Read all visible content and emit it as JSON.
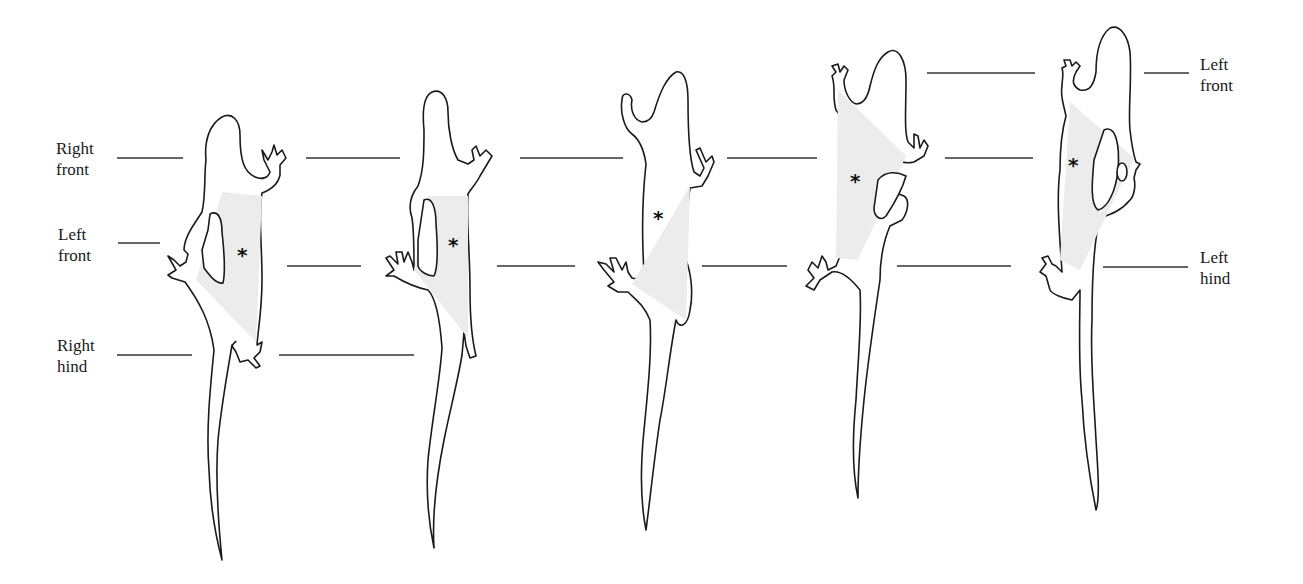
{
  "labels": {
    "left": {
      "right_front": [
        "Right",
        "front"
      ],
      "left_front": [
        "Left",
        "front"
      ],
      "right_hind": [
        "Right",
        "hind"
      ]
    },
    "right": {
      "left_front": [
        "Left",
        "front"
      ],
      "left_hind": [
        "Left",
        "hind"
      ]
    }
  },
  "figures": [
    {
      "id": 1,
      "marker": "*",
      "description": "lizard stride stage 1, support triangle shaded"
    },
    {
      "id": 2,
      "marker": "*",
      "description": "lizard stride stage 2, support triangle shaded"
    },
    {
      "id": 3,
      "marker": "*",
      "description": "lizard stride stage 3, support triangle shaded"
    },
    {
      "id": 4,
      "marker": "*",
      "description": "lizard stride stage 4, support triangle shaded"
    },
    {
      "id": 5,
      "marker": "*",
      "description": "lizard stride stage 5, support triangle shaded"
    }
  ],
  "colors": {
    "outline": "#1a1a1a",
    "support_shading": "#ececec",
    "reference_line": "#333333",
    "background": "#ffffff"
  }
}
